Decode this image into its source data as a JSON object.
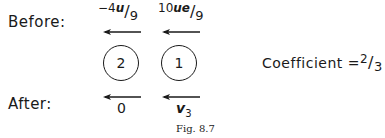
{
  "figure": {
    "before_label": "Before:",
    "after_label": "After:",
    "caption": "Fig. 8.7",
    "coefficient": {
      "label": "Coefficient =",
      "numerator": "2",
      "denominator": "3"
    },
    "balls": [
      {
        "id": "2",
        "label": "2"
      },
      {
        "id": "1",
        "label": "1"
      }
    ],
    "before": {
      "ball2": {
        "sign": "−",
        "coef": "4",
        "var": "u",
        "denominator": "9",
        "direction": "left"
      },
      "ball1": {
        "coef": "10",
        "var": "ue",
        "denominator": "9",
        "direction": "left"
      }
    },
    "after": {
      "ball2": {
        "value": "0",
        "direction": "left"
      },
      "ball1": {
        "var": "v",
        "subscript": "3",
        "direction": "left"
      }
    }
  }
}
